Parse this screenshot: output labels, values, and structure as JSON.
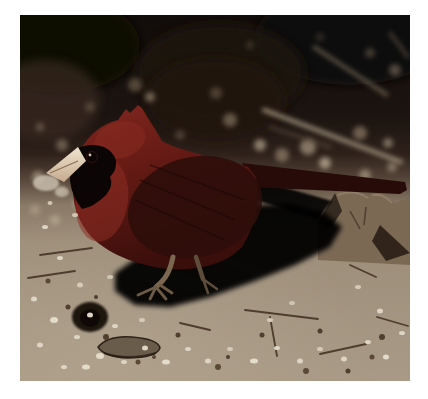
{
  "photo": {
    "alt": "Photograph of an adult male Northern Cardinal standing on bare dirt. The deep-red bird faces left with a raised pointed crest, black face mask, and a pale cream beak holding a seed. The dark, out-of-focus background shows leaf litter, light speckles and fallen twigs. The tan ground is strewn with pebbles, white seed husks and small sticks; a rocky dirt mound rises at the right and the bird casts a long black shadow to its right."
  },
  "scene": {
    "background": "dark out-of-focus woodland litter with blurred twigs and light bokeh speckles",
    "subject": "male Northern Cardinal facing left, crest raised, pale beak with seed",
    "ground": "bare tan dirt with pebbles, seed husks and twigs",
    "shadow": "long black shadow cast to the bird's right",
    "mound": "rough dirt and rock mound at the right edge",
    "hole": "small dark hole in the soil at lower left",
    "rock": "flat dark stone lying on the dirt at lower left"
  },
  "palette": {
    "page_background": "#ffffff",
    "background_top": "#120d0a",
    "background_mid": "#32251c",
    "bokeh_light": "#a4947c",
    "ground_far": "#6f604f",
    "ground_near": "#a89a86",
    "pebble_light": "#ddd4c3",
    "pebble_dark": "#4f3f2f",
    "twig_light": "#b9aa90",
    "twig_dark": "#4e3d2d",
    "soil_hole": "#1b120c",
    "flat_rock": "#6a5c4b",
    "mound": "#7b6954",
    "mound_shadow": "#241a12",
    "shadow": "#060303",
    "bird_red": "#7c241d",
    "bird_red_bright": "#8e2e23",
    "bird_dark": "#3a0e0b",
    "bird_wing": "#2c0e0a",
    "bird_tail": "#260b08",
    "face_mask": "#0c0505",
    "beak": "#efe4cf",
    "beak_shadow": "#c6ab8f",
    "seed_husk": "#c9bfae",
    "eye": "#0a0504",
    "eye_highlight": "#cdbfae",
    "leg": "#7c6850",
    "leg_rear": "#5e4d3a"
  }
}
